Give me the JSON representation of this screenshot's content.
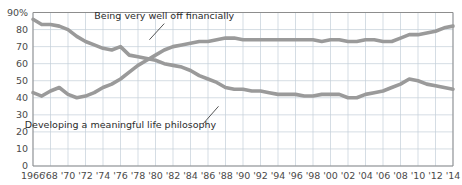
{
  "chart_data": {
    "type": "line",
    "title": "",
    "xlabel": "",
    "ylabel": "",
    "ylim": [
      0,
      90
    ],
    "ytick_suffix": "%",
    "ytick_suffix_on": 90,
    "grid": true,
    "legend_position": "inline-annotation",
    "yticks": [
      0,
      10,
      20,
      30,
      40,
      50,
      60,
      70,
      80,
      90
    ],
    "ytick_labels": [
      "0",
      "10",
      "20",
      "30",
      "40",
      "50",
      "60",
      "70",
      "80",
      "90%"
    ],
    "x": [
      1966,
      1967,
      1968,
      1969,
      1970,
      1971,
      1972,
      1973,
      1974,
      1975,
      1976,
      1977,
      1978,
      1979,
      1980,
      1981,
      1982,
      1983,
      1984,
      1985,
      1986,
      1987,
      1988,
      1989,
      1990,
      1991,
      1992,
      1993,
      1994,
      1995,
      1996,
      1997,
      1998,
      1999,
      2000,
      2001,
      2002,
      2003,
      2004,
      2005,
      2006,
      2007,
      2008,
      2009,
      2010,
      2011,
      2012,
      2013,
      2014
    ],
    "xtick_values": [
      1966,
      1968,
      1970,
      1972,
      1974,
      1976,
      1978,
      1980,
      1982,
      1984,
      1986,
      1988,
      1990,
      1992,
      1994,
      1996,
      1998,
      2000,
      2002,
      2004,
      2006,
      2008,
      2010,
      2012,
      2014
    ],
    "xtick_labels": [
      "1966",
      "'68",
      "'70",
      "'72",
      "'74",
      "'76",
      "'78",
      "'80",
      "'82",
      "'84",
      "'86",
      "'88",
      "'90",
      "'92",
      "'94",
      "'96",
      "'98",
      "'00",
      "'02",
      "'04",
      "'06",
      "'08",
      "'10",
      "'12",
      "'14"
    ],
    "series": [
      {
        "name": "Developing a meaningful life philosophy",
        "color": "#9a9a9a",
        "label_x": 1976,
        "label_y": 22,
        "values": [
          86,
          83,
          83,
          82,
          80,
          76,
          73,
          71,
          69,
          68,
          70,
          65,
          64,
          63,
          62,
          60,
          59,
          58,
          56,
          53,
          51,
          49,
          46,
          45,
          45,
          44,
          44,
          43,
          42,
          42,
          42,
          41,
          41,
          42,
          42,
          42,
          40,
          40,
          42,
          43,
          44,
          46,
          48,
          51,
          50,
          48,
          47,
          46,
          45
        ]
      },
      {
        "name": "Being very well off financially",
        "color": "#9a9a9a",
        "label_x": 1981,
        "label_y": 86,
        "values": [
          43,
          41,
          44,
          46,
          42,
          40,
          41,
          43,
          46,
          48,
          51,
          55,
          59,
          62,
          65,
          68,
          70,
          71,
          72,
          73,
          73,
          74,
          75,
          75,
          74,
          74,
          74,
          74,
          74,
          74,
          74,
          74,
          74,
          73,
          74,
          74,
          73,
          73,
          74,
          74,
          73,
          73,
          75,
          77,
          77,
          78,
          79,
          81,
          82
        ]
      }
    ]
  }
}
